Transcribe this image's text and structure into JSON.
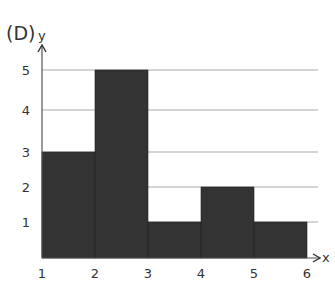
{
  "figure_label": "(D)",
  "chart_data": {
    "type": "bar",
    "subtype": "histogram",
    "title": "",
    "panel_label": "(D)",
    "xlabel": "x",
    "ylabel": "y",
    "bins": [
      [
        1,
        2
      ],
      [
        2,
        3
      ],
      [
        3,
        4
      ],
      [
        4,
        5
      ],
      [
        5,
        6
      ]
    ],
    "categories": [
      "1-2",
      "2-3",
      "3-4",
      "4-5",
      "5-6"
    ],
    "values": [
      3,
      5,
      1,
      2,
      1
    ],
    "x_ticks": [
      1,
      2,
      3,
      4,
      5,
      6
    ],
    "y_ticks": [
      1,
      2,
      3,
      4,
      5
    ],
    "xlim": [
      1,
      6
    ],
    "ylim": [
      0,
      5
    ],
    "grid": "horizontal",
    "legend": null,
    "bar_color": "#333333",
    "grid_color": "#aaaaaa"
  }
}
